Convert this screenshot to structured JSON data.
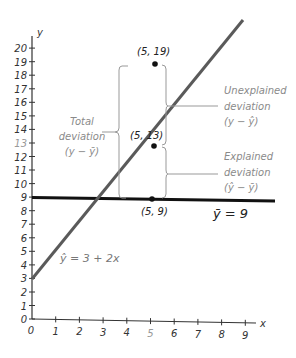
{
  "diagram": {
    "x_axis": {
      "label": "x",
      "ticks": [
        "0",
        "1",
        "2",
        "3",
        "4",
        "5",
        "6",
        "7",
        "8",
        "9"
      ]
    },
    "y_axis": {
      "label": "y",
      "ticks": [
        "0",
        "1",
        "2",
        "3",
        "4",
        "5",
        "6",
        "7",
        "8",
        "9",
        "10",
        "11",
        "12",
        "13",
        "14",
        "15",
        "16",
        "17",
        "18",
        "19",
        "20"
      ]
    },
    "points": [
      {
        "label": "(5, 19)",
        "x": 5,
        "y": 19
      },
      {
        "label": "(5, 13)",
        "x": 5,
        "y": 13
      },
      {
        "label": "(5, 9)",
        "x": 5,
        "y": 9
      }
    ],
    "regression_line": {
      "label": "ŷ = 3 + 2x",
      "intercept": 3,
      "slope": 2,
      "color": "#555555"
    },
    "mean_line": {
      "label": "ȳ = 9",
      "value": 9,
      "color": "#111111"
    },
    "annotations": {
      "total": {
        "line1": "Total",
        "line2": "deviation",
        "line3": "(y − ȳ)"
      },
      "unexplained": {
        "line1": "Unexplained",
        "line2": "deviation",
        "line3": "(y − ŷ)"
      },
      "explained": {
        "line1": "Explained",
        "line2": "deviation",
        "line3": "(ŷ − ȳ)"
      }
    }
  }
}
